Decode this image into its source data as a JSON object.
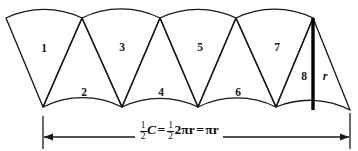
{
  "figure": {
    "wedge_labels": [
      "1",
      "2",
      "3",
      "4",
      "5",
      "6",
      "7",
      "8"
    ],
    "radius_label": "r",
    "dimension": {
      "formula_text": "1/2 C = 1/2 2πr = πr",
      "half_numerator": "1",
      "half_denominator": "2",
      "circumference_symbol": "C",
      "equals": "=",
      "two_pi_r": "2πr",
      "pi_r": "πr"
    },
    "colors": {
      "stroke": "#16181a",
      "background": "#ffffff",
      "radius_line": "#000000",
      "text": "#0d0f11"
    }
  }
}
